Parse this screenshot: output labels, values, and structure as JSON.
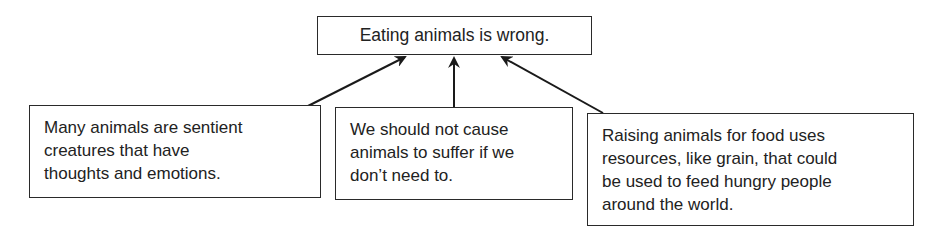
{
  "diagram": {
    "type": "argument-map",
    "claim": "Eating animals is wrong.",
    "reasons": [
      {
        "text": "Many animals are sentient\ncreatures that have\nthoughts and emotions."
      },
      {
        "text": "We should not cause\nanimals to suffer if we\ndon’t need to."
      },
      {
        "text": "Raising animals for food uses\nresources, like grain, that could\nbe used to feed hungry people\naround the world."
      }
    ],
    "edges": [
      {
        "from": "reason-1",
        "to": "claim"
      },
      {
        "from": "reason-2",
        "to": "claim"
      },
      {
        "from": "reason-3",
        "to": "claim"
      }
    ],
    "colors": {
      "line": "#1a1a1a",
      "text": "#222222",
      "background": "#ffffff"
    }
  }
}
